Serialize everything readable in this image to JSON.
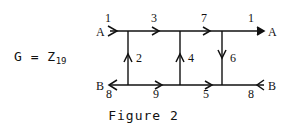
{
  "formula": {
    "base": "G = Z",
    "subscript": "19"
  },
  "caption": "Figure 2",
  "nodes": {
    "a_left": "A",
    "a_right": "A",
    "b_left": "B",
    "b_right": "B"
  },
  "edges": {
    "top": [
      {
        "label": "1",
        "direction": "right"
      },
      {
        "label": "3",
        "direction": "right"
      },
      {
        "label": "7",
        "direction": "right"
      },
      {
        "label": "1",
        "direction": "right"
      }
    ],
    "bottom": [
      {
        "label": "8",
        "direction": "left"
      },
      {
        "label": "9",
        "direction": "right"
      },
      {
        "label": "5",
        "direction": "right"
      },
      {
        "label": "8",
        "direction": "left"
      }
    ],
    "vertical": [
      {
        "label": "2",
        "direction": "up"
      },
      {
        "label": "4",
        "direction": "up"
      },
      {
        "label": "6",
        "direction": "down"
      }
    ]
  },
  "colors": {
    "background": "#ffffff",
    "ink": "#111111"
  }
}
